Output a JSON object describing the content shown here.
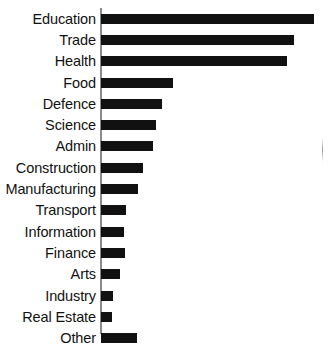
{
  "chart_data": {
    "type": "bar",
    "orientation": "horizontal",
    "title": "",
    "subtitle": "",
    "xlabel": "",
    "ylabel": "",
    "grid": false,
    "legend": null,
    "axis": {
      "value_axis": "x",
      "category_axis": "y",
      "ticks": [],
      "tick_labels": [],
      "xlim": [
        0,
        215
      ]
    },
    "categories": [
      "Education",
      "Trade",
      "Health",
      "Food",
      "Defence",
      "Science",
      "Admin",
      "Construction",
      "Manufacturing",
      "Transport",
      "Information",
      "Finance",
      "Arts",
      "Industry",
      "Real Estate",
      "Other"
    ],
    "values": [
      214,
      194,
      187,
      72,
      61,
      55,
      52,
      42,
      37,
      25,
      23,
      24,
      19,
      12,
      11,
      36
    ],
    "bar_color": "#111111",
    "background_color": "#ffffff",
    "axis_color": "#8a8a8a"
  }
}
